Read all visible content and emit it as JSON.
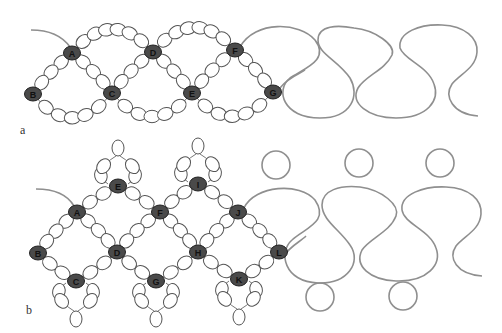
{
  "colors": {
    "thread": "#8f8f8f",
    "bead_stroke": "#555555",
    "bead_fill": "#ffffff",
    "key_bead_fill": "#4a4a4a",
    "key_text": "#111111"
  },
  "figures": [
    {
      "id": "a",
      "label": "a",
      "label_pos": [
        20,
        133
      ],
      "key_beads": [
        {
          "letter": "A",
          "x": 72,
          "y": 53
        },
        {
          "letter": "D",
          "x": 153,
          "y": 52
        },
        {
          "letter": "F",
          "x": 235,
          "y": 50
        },
        {
          "letter": "B",
          "x": 33,
          "y": 94
        },
        {
          "letter": "C",
          "x": 112,
          "y": 93
        },
        {
          "letter": "E",
          "x": 192,
          "y": 93
        },
        {
          "letter": "G",
          "x": 273,
          "y": 92
        }
      ]
    },
    {
      "id": "b",
      "label": "b",
      "label_pos": [
        26,
        313
      ],
      "key_beads": [
        {
          "letter": "E",
          "x": 118,
          "y": 186
        },
        {
          "letter": "I",
          "x": 198,
          "y": 184
        },
        {
          "letter": "A",
          "x": 77,
          "y": 212
        },
        {
          "letter": "F",
          "x": 160,
          "y": 212
        },
        {
          "letter": "J",
          "x": 238,
          "y": 212
        },
        {
          "letter": "B",
          "x": 38,
          "y": 253
        },
        {
          "letter": "D",
          "x": 117,
          "y": 252
        },
        {
          "letter": "H",
          "x": 198,
          "y": 252
        },
        {
          "letter": "L",
          "x": 279,
          "y": 252
        },
        {
          "letter": "C",
          "x": 76,
          "y": 281
        },
        {
          "letter": "G",
          "x": 156,
          "y": 281
        },
        {
          "letter": "K",
          "x": 239,
          "y": 279
        }
      ]
    }
  ]
}
